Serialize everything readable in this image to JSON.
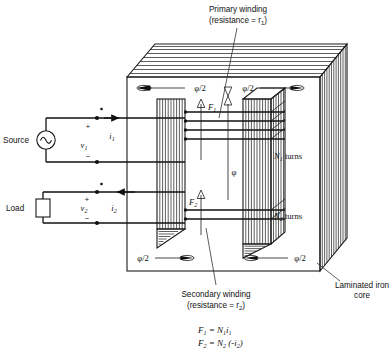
{
  "figure": {
    "type": "engineering-diagram"
  },
  "annotations": {
    "primary_winding_line1": "Primary winding",
    "primary_winding_line2_pre": "(resistance = ",
    "primary_winding_line2_var": "r",
    "primary_winding_line2_sub": "1",
    "primary_winding_line2_post": ")",
    "secondary_winding_line1": "Secondary winding",
    "secondary_winding_line2_pre": "(resistance = ",
    "secondary_winding_line2_var": "r",
    "secondary_winding_line2_sub": "2",
    "secondary_winding_line2_post": ")",
    "laminated_core_line1": "Laminated iron",
    "laminated_core_line2": "core"
  },
  "circuit": {
    "source_label": "Source",
    "load_label": "Load",
    "primary_voltage": "v",
    "primary_voltage_sub": "1",
    "secondary_voltage": "v",
    "secondary_voltage_sub": "2",
    "primary_current": "i",
    "primary_current_sub": "1",
    "secondary_current": "i",
    "secondary_current_sub": "2",
    "plus_primary": "+",
    "minus_primary": "−",
    "plus_secondary": "+",
    "minus_secondary": "−",
    "source_symbol": "ac-source-sine",
    "load_symbol": "load-box"
  },
  "core": {
    "flux_half_top_left": "φ/2",
    "flux_half_top_right": "φ/2",
    "flux_half_bottom_left": "φ/2",
    "flux_half_bottom_right": "φ/2",
    "flux_center": "φ",
    "mmf_primary": "F",
    "mmf_primary_sub": "1",
    "mmf_secondary": "F",
    "mmf_secondary_sub": "2",
    "turns_primary_var": "N",
    "turns_primary_sub": "1",
    "turns_primary_word": "turns",
    "turns_secondary_var": "N",
    "turns_secondary_sub": "2",
    "turns_secondary_word": "turns"
  },
  "equations": {
    "eq1": "F₁ = N₁i₁",
    "eq2": "F₂ = N₂ (-i₂)",
    "eq1_parts": {
      "lhs": "F",
      "lhs_sub": "1",
      "rhs_n": "N",
      "rhs_n_sub": "1",
      "rhs_i": "i",
      "rhs_i_sub": "1"
    },
    "eq2_parts": {
      "lhs": "F",
      "lhs_sub": "2",
      "rhs_n": "N",
      "rhs_n_sub": "2",
      "rhs_i": "-i",
      "rhs_i_sub": "2"
    }
  },
  "colors": {
    "ink": "#111111",
    "background": "#ffffff",
    "leader": "#333333"
  }
}
